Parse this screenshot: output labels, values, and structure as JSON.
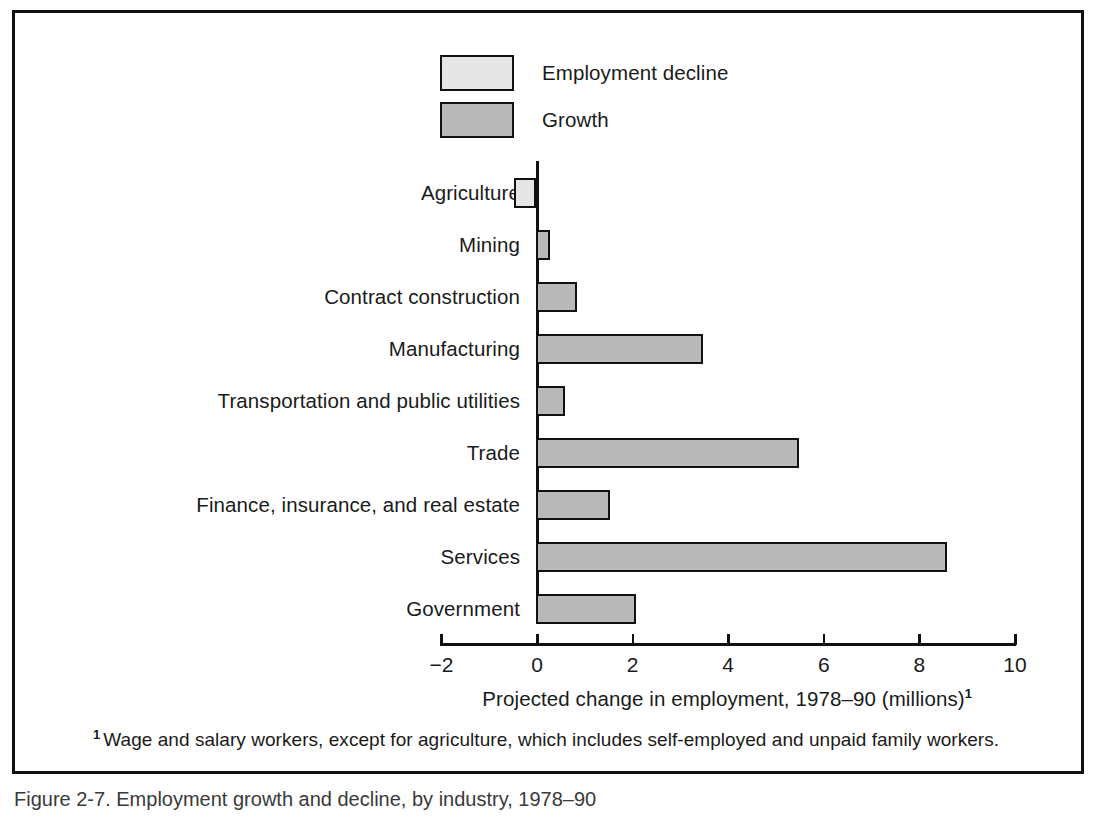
{
  "figure": {
    "caption": "Figure 2-7. Employment growth and decline, by industry, 1978–90"
  },
  "legend": {
    "position": "top-center",
    "entries": [
      {
        "label": "Employment decline",
        "color": "#e6e6e6",
        "swatch_name": "legend-swatch-employment-decline"
      },
      {
        "label": "Growth",
        "color": "#b9b9b9",
        "swatch_name": "legend-swatch-growth"
      }
    ]
  },
  "axis": {
    "title": "Projected change in employment, 1978–90 (millions)",
    "title_superscript": "1",
    "ticks": [
      "−2",
      "0",
      "2",
      "4",
      "6",
      "8",
      "10"
    ],
    "min": -2,
    "max": 10
  },
  "footnote": {
    "marker": "1",
    "text": "Wage and salary workers, except for agriculture, which includes self-employed and  unpaid family workers."
  },
  "chart_data": {
    "type": "bar",
    "orientation": "horizontal",
    "title": "",
    "xlabel": "Projected change in employment, 1978–90 (millions)",
    "ylabel": "",
    "xlim": [
      -2,
      10
    ],
    "grid": false,
    "legend_position": "top-center",
    "categories": [
      "Agriculture",
      "Mining",
      "Contract construction",
      "Manufacturing",
      "Transportation and public utilities",
      "Trade",
      "Finance, insurance, and real estate",
      "Services",
      "Government"
    ],
    "values": [
      -0.45,
      0.3,
      0.85,
      3.5,
      0.6,
      5.5,
      1.55,
      8.6,
      2.1
    ],
    "series": [
      {
        "name": "Employment decline",
        "color": "#e6e6e6",
        "values": [
          -0.45,
          null,
          null,
          null,
          null,
          null,
          null,
          null,
          null
        ]
      },
      {
        "name": "Growth",
        "color": "#b9b9b9",
        "values": [
          null,
          0.3,
          0.85,
          3.5,
          0.6,
          5.5,
          1.55,
          8.6,
          2.1
        ]
      }
    ],
    "bars": [
      {
        "category": "Agriculture",
        "value": -0.45,
        "series": "Employment decline",
        "color": "#e6e6e6"
      },
      {
        "category": "Mining",
        "value": 0.3,
        "series": "Growth",
        "color": "#b9b9b9"
      },
      {
        "category": "Contract construction",
        "value": 0.85,
        "series": "Growth",
        "color": "#b9b9b9"
      },
      {
        "category": "Manufacturing",
        "value": 3.5,
        "series": "Growth",
        "color": "#b9b9b9"
      },
      {
        "category": "Transportation and public utilities",
        "value": 0.6,
        "series": "Growth",
        "color": "#b9b9b9"
      },
      {
        "category": "Trade",
        "value": 5.5,
        "series": "Growth",
        "color": "#b9b9b9"
      },
      {
        "category": "Finance, insurance, and real estate",
        "value": 1.55,
        "series": "Growth",
        "color": "#b9b9b9"
      },
      {
        "category": "Services",
        "value": 8.6,
        "series": "Growth",
        "color": "#b9b9b9"
      },
      {
        "category": "Government",
        "value": 2.1,
        "series": "Growth",
        "color": "#b9b9b9"
      }
    ]
  }
}
